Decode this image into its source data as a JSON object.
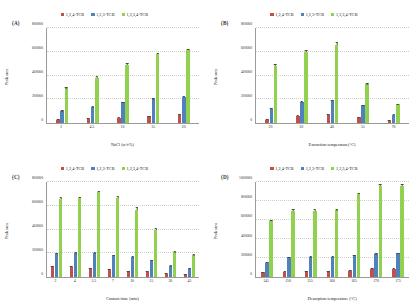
{
  "figure": {
    "series_colors": {
      "s124": "#C0504D",
      "s123": "#4F81BD",
      "s1234": "#92D050"
    },
    "legend": [
      {
        "label": "1,2,4-TCB",
        "color": "#C0504D"
      },
      {
        "label": "1,2,3-TCB",
        "color": "#4F81BD"
      },
      {
        "label": "1,2,3,4-TCB",
        "color": "#92D050"
      }
    ]
  },
  "chart_data": [
    {
      "type": "bar",
      "panel": "(A)",
      "title": "",
      "xlabel": "NaCl (w/v%)",
      "ylabel": "Peak area",
      "categories": [
        "2",
        "4.5",
        "10",
        "15",
        "20"
      ],
      "yticks": [
        0,
        200000,
        400000,
        600000,
        800000
      ],
      "ylim": [
        0,
        800000
      ],
      "grid": true,
      "legend_position": "top-center",
      "series": [
        {
          "name": "1,2,4-TCB",
          "values": [
            28000,
            34000,
            45000,
            58000,
            72000
          ],
          "errors": [
            4000,
            4000,
            5000,
            5000,
            6000
          ]
        },
        {
          "name": "1,2,3-TCB",
          "values": [
            103000,
            135000,
            175000,
            200000,
            222000
          ],
          "errors": [
            7000,
            8000,
            9000,
            9000,
            10000
          ]
        },
        {
          "name": "1,2,3,4-TCB",
          "values": [
            292000,
            383000,
            492000,
            578000,
            612000
          ],
          "errors": [
            14000,
            18000,
            12000,
            14000,
            13000
          ]
        }
      ]
    },
    {
      "type": "bar",
      "panel": "(B)",
      "title": "",
      "xlabel": "Extraction temperature(°C)",
      "ylabel": "Peak area",
      "categories": [
        "20",
        "30",
        "40",
        "55",
        "70"
      ],
      "yticks": [
        0,
        200000,
        400000,
        600000,
        800000
      ],
      "ylim": [
        0,
        800000
      ],
      "grid": true,
      "legend_position": "top-center",
      "series": [
        {
          "name": "1,2,4-TCB",
          "values": [
            27000,
            62000,
            70000,
            50000,
            18000
          ],
          "errors": [
            4000,
            5000,
            5000,
            5000,
            3000
          ]
        },
        {
          "name": "1,2,3-TCB",
          "values": [
            122000,
            178000,
            190000,
            148000,
            68000
          ],
          "errors": [
            8000,
            9000,
            9000,
            8000,
            6000
          ]
        },
        {
          "name": "1,2,3,4-TCB",
          "values": [
            478000,
            600000,
            660000,
            325000,
            158000
          ],
          "errors": [
            22000,
            14000,
            22000,
            16000,
            9000
          ]
        }
      ]
    },
    {
      "type": "bar",
      "panel": "(C)",
      "title": "",
      "xlabel": "Contact time (min)",
      "ylabel": "Peak area",
      "categories": [
        "2",
        "4",
        "5.5",
        "7",
        "10",
        "15",
        "30",
        "45"
      ],
      "yticks": [
        0,
        200000,
        400000,
        600000,
        800000
      ],
      "ylim": [
        0,
        800000
      ],
      "grid": true,
      "legend_position": "top-center",
      "series": [
        {
          "name": "1,2,4-TCB",
          "values": [
            92000,
            86000,
            74000,
            66000,
            47000,
            44000,
            28000,
            24000
          ],
          "errors": [
            6000,
            6000,
            5000,
            5000,
            5000,
            5000,
            4000,
            4000
          ]
        },
        {
          "name": "1,2,3-TCB",
          "values": [
            199000,
            203000,
            203000,
            182000,
            168000,
            140000,
            92000,
            72000
          ],
          "errors": [
            9000,
            9000,
            9000,
            8000,
            8000,
            8000,
            7000,
            6000
          ]
        },
        {
          "name": "1,2,3,4-TCB",
          "values": [
            655000,
            662000,
            712000,
            662000,
            562000,
            400000,
            208000,
            182000
          ],
          "errors": [
            16000,
            14000,
            12000,
            16000,
            36000,
            16000,
            14000,
            22000
          ]
        }
      ]
    },
    {
      "type": "bar",
      "panel": "(D)",
      "title": "",
      "xlabel": "Desorption temperature (°C)",
      "ylabel": "Peak area",
      "categories": [
        "145",
        "150",
        "155",
        "160",
        "165",
        "170",
        "175"
      ],
      "yticks": [
        0,
        200000,
        400000,
        600000,
        800000,
        1000000
      ],
      "ylim": [
        0,
        1000000
      ],
      "grid": true,
      "legend_position": "top-center",
      "series": [
        {
          "name": "1,2,4-TCB",
          "values": [
            52000,
            58000,
            60000,
            62000,
            66000,
            84000,
            88000
          ],
          "errors": [
            5000,
            5000,
            5000,
            5000,
            5000,
            6000,
            6000
          ]
        },
        {
          "name": "1,2,3-TCB",
          "values": [
            152000,
            208000,
            210000,
            212000,
            228000,
            240000,
            250000
          ],
          "errors": [
            9000,
            9000,
            9000,
            9000,
            9000,
            10000,
            10000
          ]
        },
        {
          "name": "1,2,3,4-TCB",
          "values": [
            585000,
            700000,
            700000,
            702000,
            872000,
            958000,
            958000
          ],
          "errors": [
            22000,
            10000,
            10000,
            10000,
            12000,
            12000,
            12000
          ]
        }
      ]
    }
  ]
}
